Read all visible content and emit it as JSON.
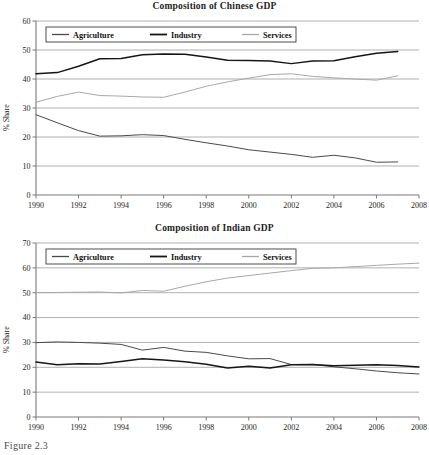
{
  "page": {
    "caption": "Figure 2.3"
  },
  "colors": {
    "agriculture": "#4a4a4a",
    "industry": "#161616",
    "services": "#a8a8a8",
    "grid": "#8e8e8e",
    "axis": "#7a7a7a",
    "text": "#1d1d1d"
  },
  "charts": [
    {
      "id": "chinese-gdp",
      "title": "Composition of Chinese GDP",
      "ylabel": "% Share",
      "legend": [
        "Agriculture",
        "Industry",
        "Services"
      ]
    },
    {
      "id": "indian-gdp",
      "title": "Composition of Indian GDP",
      "ylabel": "% Share",
      "legend": [
        "Agriculture",
        "Industry",
        "Services"
      ]
    }
  ],
  "chart_data": [
    {
      "type": "line",
      "title": "Composition of Chinese GDP",
      "xlabel": "",
      "ylabel": "% Share",
      "xlim": [
        1990,
        2008
      ],
      "ylim": [
        0,
        60
      ],
      "xticks": [
        1990,
        1992,
        1994,
        1996,
        1998,
        2000,
        2002,
        2004,
        2006,
        2008
      ],
      "yticks": [
        0,
        10,
        20,
        30,
        40,
        50,
        60
      ],
      "grid": true,
      "legend_position": "top-left",
      "x": [
        1990,
        1991,
        1992,
        1993,
        1994,
        1995,
        1996,
        1997,
        1998,
        1999,
        2000,
        2001,
        2002,
        2003,
        2004,
        2005,
        2006,
        2007
      ],
      "series": [
        {
          "name": "Agriculture",
          "values": [
            27.7,
            24.9,
            22.2,
            20.3,
            20.4,
            20.8,
            20.5,
            19.2,
            18.0,
            16.9,
            15.6,
            14.8,
            14.0,
            13.0,
            13.7,
            12.8,
            11.3,
            11.4
          ]
        },
        {
          "name": "Industry",
          "values": [
            41.8,
            42.2,
            44.4,
            47.0,
            47.1,
            48.4,
            48.6,
            48.5,
            47.6,
            46.5,
            46.4,
            46.2,
            45.3,
            46.2,
            46.3,
            47.7,
            48.9,
            49.5
          ]
        },
        {
          "name": "Services",
          "values": [
            32.0,
            34.0,
            35.5,
            34.3,
            34.1,
            33.8,
            33.7,
            35.5,
            37.5,
            39.0,
            40.3,
            41.5,
            41.8,
            40.9,
            40.4,
            40.0,
            39.6,
            41.1
          ]
        }
      ]
    },
    {
      "type": "line",
      "title": "Composition of Indian GDP",
      "xlabel": "",
      "ylabel": "% Share",
      "xlim": [
        1990,
        2008
      ],
      "ylim": [
        0,
        70
      ],
      "xticks": [
        1990,
        1992,
        1994,
        1996,
        1998,
        2000,
        2002,
        2004,
        2006,
        2008
      ],
      "yticks": [
        0,
        10,
        20,
        30,
        40,
        50,
        60,
        70
      ],
      "grid": true,
      "legend_position": "top-left",
      "x": [
        1990,
        1991,
        1992,
        1993,
        1994,
        1995,
        1996,
        1997,
        1998,
        1999,
        2000,
        2001,
        2002,
        2003,
        2004,
        2005,
        2006,
        2007,
        2008
      ],
      "series": [
        {
          "name": "Agriculture",
          "values": [
            29.9,
            30.2,
            30.0,
            29.7,
            29.2,
            26.9,
            28.0,
            26.5,
            26.0,
            24.6,
            23.4,
            23.5,
            21.1,
            21.1,
            20.2,
            19.4,
            18.5,
            17.8,
            17.3
          ]
        },
        {
          "name": "Industry",
          "values": [
            22.1,
            21.0,
            21.4,
            21.3,
            22.3,
            23.4,
            22.9,
            22.2,
            21.2,
            19.7,
            20.4,
            19.7,
            21.0,
            21.1,
            20.6,
            20.8,
            21.0,
            20.7,
            20.1
          ]
        },
        {
          "name": "Services",
          "values": [
            50.0,
            50.1,
            50.2,
            50.3,
            49.9,
            50.9,
            50.6,
            52.6,
            54.4,
            55.9,
            56.9,
            57.9,
            58.9,
            59.8,
            60.0,
            60.5,
            61.0,
            61.5,
            61.9
          ]
        }
      ]
    }
  ]
}
